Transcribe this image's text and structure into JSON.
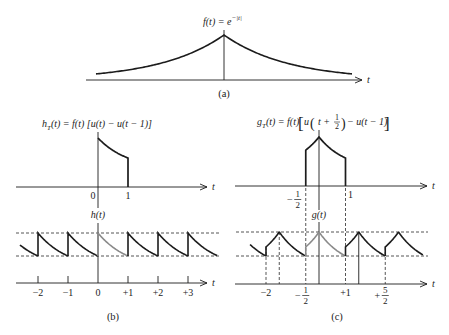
{
  "figure": {
    "colors": {
      "line": "#1c1c1c",
      "highlight": "#8a8a8a",
      "guide": "#2a2a2a",
      "background": "#ffffff"
    },
    "panel_a": {
      "caption": "(a)",
      "title": {
        "base": "f(t) = e",
        "exponent": "−|t|"
      },
      "axis_label": "t",
      "signal": {
        "function": "exp(-|t|)",
        "t_range": [
          -2,
          2
        ]
      }
    },
    "panel_b": {
      "caption": "(b)",
      "top": {
        "title": {
          "base": "h",
          "sub": "T",
          "rest": "(t) = f(t) [u(t) − u(t − 1)]"
        },
        "axis_label": "t",
        "signal": {
          "function": "exp(-|t|)",
          "window": [
            0,
            1
          ]
        },
        "ticks": [
          {
            "value": 0,
            "label": "0"
          },
          {
            "value": 1,
            "label": "1"
          }
        ]
      },
      "bottom": {
        "signal_label": "h(t)",
        "axis_label": "t",
        "signal": {
          "function": "exp(-|t|)",
          "window": [
            0,
            1
          ],
          "period": 1,
          "t_range": [
            -2.6,
            3.97
          ],
          "highlighted_copy": 0
        },
        "ticks": [
          {
            "value": -2,
            "label": "−2"
          },
          {
            "value": -1,
            "label": "−1"
          },
          {
            "value": 0,
            "label": "0"
          },
          {
            "value": 1,
            "label": "+1"
          },
          {
            "value": 2,
            "label": "+2"
          },
          {
            "value": 3,
            "label": "+3"
          }
        ]
      }
    },
    "panel_c": {
      "caption": "(c)",
      "top": {
        "title": {
          "base": "g",
          "sub": "T",
          "mid": "(t) = f(t)",
          "open_bracket": "[",
          "u": "u",
          "open_paren": "(",
          "arg": "t +",
          "frac_num": "1",
          "frac_den": "2",
          "close_paren": ")",
          "rest": "− u(t − 1)",
          "close_bracket": "]"
        },
        "axis_label": "t",
        "signal": {
          "function": "exp(-|t|)",
          "window": [
            -0.5,
            1
          ]
        },
        "ticks": [
          {
            "value": -0.5,
            "sign": "−",
            "num": "1",
            "den": "2"
          },
          {
            "value": 1,
            "label": "1"
          }
        ]
      },
      "bottom": {
        "signal_label": "g(t)",
        "axis_label": "t",
        "signal": {
          "function": "exp(-|t|)",
          "window": [
            -0.5,
            1
          ],
          "period": 1.5,
          "t_range": [
            -2.6,
            3.92
          ],
          "highlighted_copy": 0
        },
        "ticks": [
          {
            "value": -2,
            "label": "−2"
          },
          {
            "value": -0.5,
            "sign": "−",
            "num": "1",
            "den": "2"
          },
          {
            "value": 1,
            "label": "+1"
          },
          {
            "value": 2.5,
            "sign": "+",
            "num": "5",
            "den": "2"
          }
        ],
        "guides": [
          {
            "t": -2,
            "style": "dashed",
            "span": "signal"
          },
          {
            "t": -1.5,
            "style": "dashed",
            "span": "signal"
          },
          {
            "t": -0.5,
            "style": "dashed",
            "span": "full"
          },
          {
            "t": 1,
            "style": "dashed",
            "span": "full"
          },
          {
            "t": 1.5,
            "style": "solid",
            "span": "signal"
          },
          {
            "t": 2.5,
            "style": "dashed",
            "span": "signal"
          }
        ]
      }
    }
  }
}
